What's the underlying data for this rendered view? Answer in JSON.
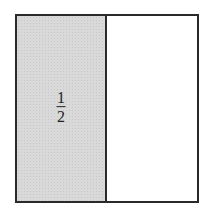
{
  "diagram": {
    "shape": "square divided into two equal halves",
    "shaded_color": "#d9d9d9",
    "border_color": "#2a2a2a",
    "left_half": {
      "shaded": true,
      "label": {
        "numerator": "1",
        "denominator": "2"
      }
    },
    "right_half": {
      "shaded": false
    }
  }
}
